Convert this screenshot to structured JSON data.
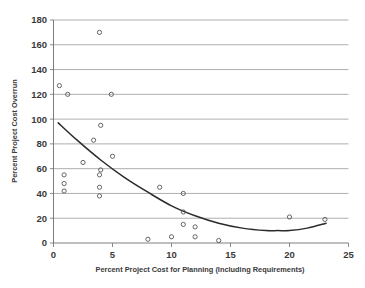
{
  "chart_data": {
    "type": "scatter",
    "title": "",
    "subtitle": "",
    "xlabel": "Percent Project Cost for Planning (Including Requirements)",
    "ylabel": "Percent Project Cost Overrun",
    "xlim": [
      0,
      25
    ],
    "ylim": [
      0,
      180
    ],
    "xticks": [
      0,
      5,
      10,
      15,
      20,
      25
    ],
    "yticks": [
      0,
      20,
      40,
      60,
      80,
      100,
      120,
      140,
      160,
      180
    ],
    "grid": "horizontal",
    "legend": "none",
    "marker_style": "open-circle",
    "points": [
      {
        "x": 0.5,
        "y": 127
      },
      {
        "x": 1.2,
        "y": 120
      },
      {
        "x": 4.9,
        "y": 120
      },
      {
        "x": 3.9,
        "y": 170
      },
      {
        "x": 4.0,
        "y": 95
      },
      {
        "x": 3.4,
        "y": 83
      },
      {
        "x": 5.0,
        "y": 70
      },
      {
        "x": 2.5,
        "y": 65
      },
      {
        "x": 4.0,
        "y": 59
      },
      {
        "x": 0.9,
        "y": 55
      },
      {
        "x": 3.9,
        "y": 55
      },
      {
        "x": 0.9,
        "y": 48
      },
      {
        "x": 3.9,
        "y": 45
      },
      {
        "x": 9.0,
        "y": 45
      },
      {
        "x": 0.9,
        "y": 42
      },
      {
        "x": 11.0,
        "y": 40
      },
      {
        "x": 3.9,
        "y": 38
      },
      {
        "x": 11.0,
        "y": 25
      },
      {
        "x": 20.0,
        "y": 21
      },
      {
        "x": 23.0,
        "y": 19
      },
      {
        "x": 11.0,
        "y": 15
      },
      {
        "x": 12.0,
        "y": 13
      },
      {
        "x": 10.0,
        "y": 5
      },
      {
        "x": 12.0,
        "y": 5
      },
      {
        "x": 8.0,
        "y": 3
      },
      {
        "x": 14.0,
        "y": 2
      }
    ],
    "trendline": {
      "type": "polynomial-quadratic",
      "description": "downward curve flattening near x=19 then rising slightly",
      "x_start": 0.4,
      "x_end": 23.1,
      "samples": [
        {
          "x": 0.4,
          "y": 97
        },
        {
          "x": 2.0,
          "y": 83
        },
        {
          "x": 4.0,
          "y": 67
        },
        {
          "x": 6.0,
          "y": 53
        },
        {
          "x": 8.0,
          "y": 41
        },
        {
          "x": 10.0,
          "y": 30
        },
        {
          "x": 12.0,
          "y": 22
        },
        {
          "x": 14.0,
          "y": 16
        },
        {
          "x": 16.0,
          "y": 12
        },
        {
          "x": 18.0,
          "y": 10
        },
        {
          "x": 19.0,
          "y": 10
        },
        {
          "x": 20.0,
          "y": 10
        },
        {
          "x": 21.5,
          "y": 12
        },
        {
          "x": 23.1,
          "y": 16
        }
      ]
    }
  },
  "axes": {
    "x_tick_labels": [
      "0",
      "5",
      "10",
      "15",
      "20",
      "25"
    ],
    "y_tick_labels": [
      "0",
      "20",
      "40",
      "60",
      "80",
      "100",
      "120",
      "140",
      "160",
      "180"
    ]
  },
  "colors": {
    "background": "#ffffff",
    "gridline": "#8d8d8d",
    "axis": "#6f6f6f",
    "marker_stroke": "#555555",
    "trendline": "#2b2b2b",
    "text": "#3a3a3a"
  }
}
